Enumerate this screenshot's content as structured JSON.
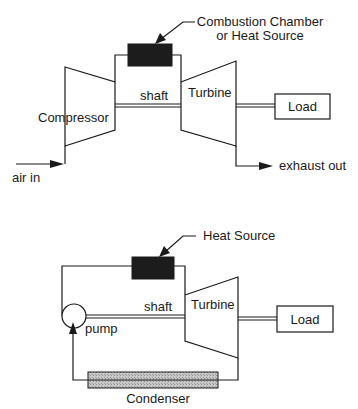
{
  "top_diagram": {
    "title": "Gas turbine (open Brayton cycle)",
    "heat_source_label_line1": "Combustion Chamber",
    "heat_source_label_line2": "or Heat Source",
    "compressor_label": "Compressor",
    "shaft_label": "shaft",
    "turbine_label": "Turbine",
    "load_label": "Load",
    "inlet_label": "air in",
    "outlet_label": "exhaust out"
  },
  "bottom_diagram": {
    "title": "Steam turbine (closed Rankine cycle)",
    "heat_source_label": "Heat Source",
    "shaft_label": "shaft",
    "turbine_label": "Turbine",
    "load_label": "Load",
    "pump_label": "pump",
    "condenser_label": "Condenser"
  },
  "colors": {
    "line": "#1a1a1a",
    "heat_source_fill": "#1c1c1c",
    "condenser_fill": "#bdbdbd",
    "background": "#ffffff"
  }
}
